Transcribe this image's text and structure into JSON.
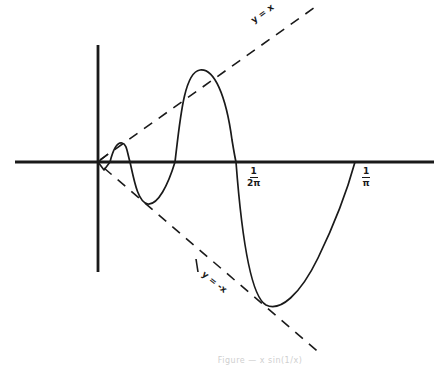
{
  "figure": {
    "type": "hand-drawn function plot",
    "axes": {
      "x_axis": {
        "from": [
          15,
          162
        ],
        "to": [
          434,
          162
        ]
      },
      "y_axis": {
        "from": [
          98,
          45
        ],
        "to": [
          98,
          272
        ]
      },
      "origin": [
        98,
        162
      ],
      "stroke_color": "#1a1a1a"
    },
    "x_tick_labels": [
      {
        "numerator": "1",
        "denominator": "2π",
        "x": 243,
        "y": 167
      },
      {
        "numerator": "1",
        "denominator": "π",
        "x": 358,
        "y": 167
      }
    ],
    "guide_lines": [
      {
        "label": "y = x",
        "from": [
          100,
          160
        ],
        "to": [
          318,
          5
        ]
      },
      {
        "label": "y = -x",
        "from": [
          104,
          168
        ],
        "to": [
          322,
          355
        ]
      }
    ],
    "curve": {
      "description": "oscillating curve x·sin(1/x) bounded by y = x and y = -x",
      "stroke_color": "#1a1a1a"
    },
    "caption": "Figure — x sin(1/x)"
  }
}
